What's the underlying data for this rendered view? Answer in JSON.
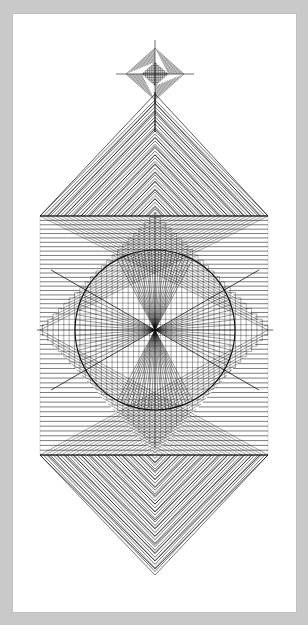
{
  "canvas": {
    "width": 308,
    "height": 625
  },
  "title": "String Art Geometric Composition",
  "medium_note": "Pen and ink line drawing on white paper sheet, gray mat background",
  "colors": {
    "mat_background": "#c9c9c9",
    "paper": "#ffffff",
    "ink": "#0d0d0d",
    "ink_light": "#2a2a2a",
    "paper_edge_shadow": "#b8b8b8"
  },
  "paper": {
    "x": 13,
    "y": 14,
    "width": 283,
    "height": 598
  },
  "composition": {
    "center": {
      "x": 155,
      "y": 330
    },
    "square_frame": {
      "left": 40,
      "top": 216,
      "right": 268,
      "bottom": 455
    },
    "inner_circle": {
      "cx": 155,
      "cy": 330,
      "r": 80
    },
    "top_spike_apex": {
      "x": 155,
      "y": 100
    },
    "bottom_spike_apex": {
      "x": 155,
      "y": 575
    },
    "finial_star": {
      "cx": 155,
      "cy": 74,
      "half_width": 29,
      "half_height": 26
    },
    "stem": {
      "x": 155,
      "top": 92,
      "bottom": 132
    },
    "strings": {
      "spike_fan_lines": 34,
      "corner_fan_lines": 26,
      "radial_fan_lines": 60,
      "diamond_fan_lines": 22,
      "finial_fan_lines": 11
    },
    "line_weights": {
      "hairline": 0.45,
      "thin": 0.6,
      "medium": 0.85,
      "heavy": 1.15
    }
  },
  "labels": {
    "artwork": "string-art-composition",
    "finial": "top-finial-star",
    "top_spike": "top-curved-spike",
    "bottom_spike": "bottom-curved-spike",
    "left_lobe": "left-side-lobe",
    "right_lobe": "right-side-lobe",
    "circle": "central-circle",
    "radial": "radial-fan-burst",
    "frame": "square-frame"
  },
  "chart_data": {
    "type": "scatter",
    "title": "String Art Geometric Composition",
    "xlabel": "",
    "ylabel": "",
    "xlim": [
      0,
      308
    ],
    "ylim": [
      0,
      625
    ],
    "grid": false,
    "legend": "none"
  }
}
